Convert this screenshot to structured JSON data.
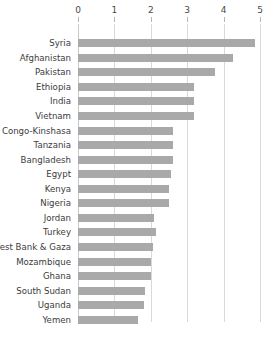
{
  "chart_data": {
    "type": "bar",
    "orientation": "horizontal",
    "title": "",
    "subtitle": "",
    "xlabel": "",
    "ylabel": "",
    "xlim": [
      0,
      5
    ],
    "ylim": null,
    "grid": true,
    "legend": null,
    "axis_ticks": [
      "0",
      "1",
      "2",
      "3",
      "4",
      "5"
    ],
    "axis_tick_values": [
      0,
      1,
      2,
      3,
      4,
      5
    ],
    "categories": [
      "Syria",
      "Afghanistan",
      "Pakistan",
      "Ethiopia",
      "India",
      "Vietnam",
      "Congo-Kinshasa",
      "Tanzania",
      "Bangladesh",
      "Egypt",
      "Kenya",
      "Nigeria",
      "Jordan",
      "Turkey",
      "West Bank & Gaza",
      "Mozambique",
      "Ghana",
      "South Sudan",
      "Uganda",
      "Yemen"
    ],
    "values": [
      4.85,
      4.25,
      3.75,
      3.2,
      3.2,
      3.2,
      2.6,
      2.6,
      2.6,
      2.55,
      2.5,
      2.5,
      2.1,
      2.15,
      2.05,
      2.0,
      2.0,
      1.85,
      1.8,
      1.65
    ],
    "colors": {
      "bar": "#a9a9a9",
      "gridline": "#d9d9d9",
      "text": "#3c3c3c",
      "background": "#ffffff"
    }
  }
}
